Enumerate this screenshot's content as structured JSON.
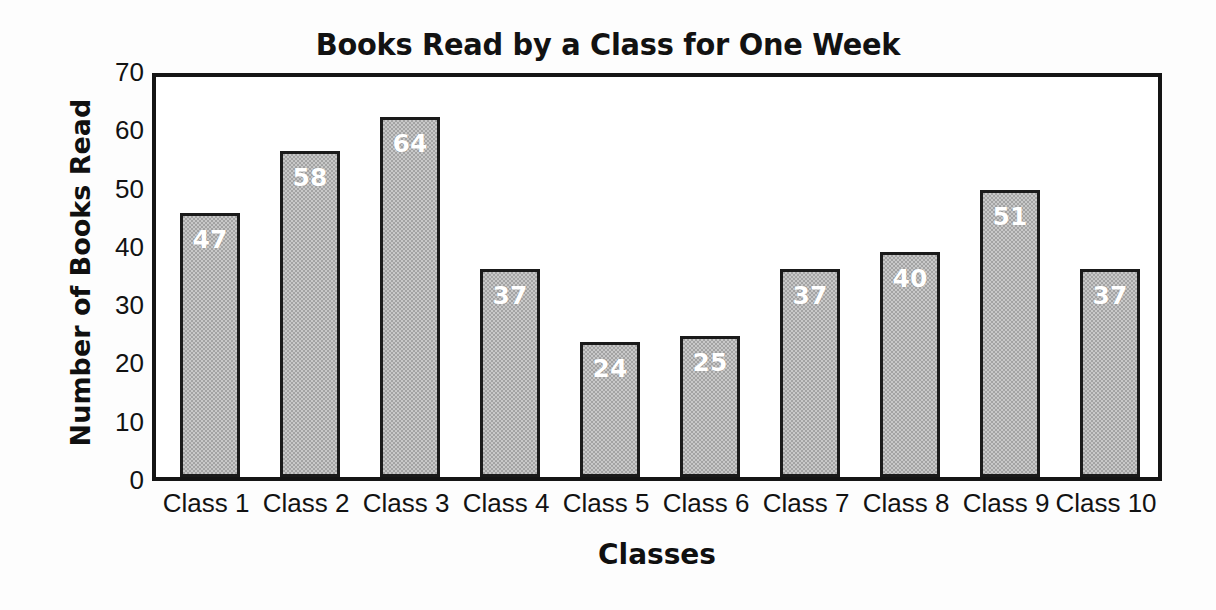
{
  "chart_data": {
    "type": "bar",
    "title": "Books Read by a Class for One Week",
    "xlabel": "Classes",
    "ylabel": "Number of Books Read",
    "categories": [
      "Class 1",
      "Class 2",
      "Class 3",
      "Class 4",
      "Class 5",
      "Class 6",
      "Class 7",
      "Class 8",
      "Class 9",
      "Class 10"
    ],
    "values": [
      47,
      58,
      64,
      37,
      24,
      25,
      37,
      40,
      51,
      37
    ],
    "ylim": [
      0,
      70
    ],
    "ytick_labels": [
      "70",
      "60",
      "50",
      "40",
      "30",
      "20",
      "10",
      "0"
    ],
    "ytick_values": [
      70,
      60,
      50,
      40,
      30,
      20,
      10,
      0
    ],
    "ytick_step": 10,
    "grid": false,
    "legend": false,
    "data_labels": [
      "47",
      "58",
      "64",
      "37",
      "24",
      "25",
      "37",
      "40",
      "51",
      "37"
    ],
    "bar_fill_color": "#a3a3a3",
    "bar_edge_color": "#1a1a1a",
    "data_label_color": "#ffffff",
    "axis_color": "#151515",
    "background_color": "#ffffff"
  }
}
